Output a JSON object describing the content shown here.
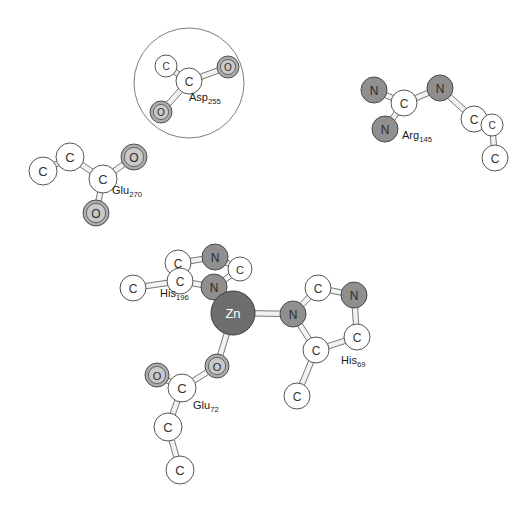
{
  "figure": {
    "title": "",
    "type": "molecular-structure-diagram",
    "style": "ball-and-stick",
    "background_color": "#ffffff"
  },
  "colors": {
    "carbon_fill": "#ffffff",
    "carbon_stroke": "#555555",
    "carbon_text": "#333333",
    "nitrogen_fill": "#8f8f8f",
    "nitrogen_stroke": "#4a4a4a",
    "nitrogen_text": "#2b2b2b",
    "oxygen_fill": "#ababab",
    "oxygen_stroke": "#4f4f4f",
    "oxygen_text": "#2b2b2b",
    "oxygen_inner": "#c9c9c9",
    "zinc_fill": "#6d6d6d",
    "zinc_stroke": "#3c3c3c",
    "zinc_text": "#ffffff",
    "bond_stroke": "#6a6a6a",
    "bond_fill": "#f2f2f2",
    "highlight_circle_stroke": "#7d7d7d",
    "label_text": "#1a1a1a"
  },
  "residues": [
    {
      "id": "asp255",
      "name": "Asp",
      "number": "255",
      "label": "Asp255",
      "label_x": 189,
      "label_y": 101,
      "label_size": 11
    },
    {
      "id": "glu270",
      "name": "Glu",
      "number": "270",
      "label": "Glu270",
      "label_x": 112,
      "label_y": 194,
      "label_size": 11
    },
    {
      "id": "arg145",
      "name": "Arg",
      "number": "145",
      "label": "Arg145",
      "label_x": 402,
      "label_y": 139,
      "label_size": 11
    },
    {
      "id": "his196",
      "name": "His",
      "number": "196",
      "label": "His196",
      "label_x": 160,
      "label_y": 297,
      "label_size": 11
    },
    {
      "id": "his69",
      "name": "His",
      "number": "69",
      "label": "His69",
      "label_x": 341,
      "label_y": 364,
      "label_size": 11
    },
    {
      "id": "glu72",
      "name": "Glu",
      "number": "72",
      "label": "Glu72",
      "label_x": 193,
      "label_y": 409,
      "label_size": 11
    }
  ],
  "highlight_circle": {
    "name": "asp255-highlight-circle",
    "cx": 189,
    "cy": 83,
    "r": 55
  },
  "chart_data": {
    "type": "diagram",
    "atoms": [
      {
        "id": "asp255-c1",
        "element": "C",
        "label": "C",
        "x": 166,
        "y": 66,
        "r": 11,
        "residue": "asp255"
      },
      {
        "id": "asp255-c2",
        "element": "C",
        "label": "C",
        "x": 189,
        "y": 81,
        "r": 13,
        "residue": "asp255"
      },
      {
        "id": "asp255-o1",
        "element": "O",
        "label": "O",
        "x": 228,
        "y": 67,
        "r": 11,
        "residue": "asp255"
      },
      {
        "id": "asp255-o2",
        "element": "O",
        "label": "O",
        "x": 161,
        "y": 112,
        "r": 11,
        "residue": "asp255"
      },
      {
        "id": "glu270-c1",
        "element": "C",
        "label": "C",
        "x": 43,
        "y": 171,
        "r": 14,
        "residue": "glu270"
      },
      {
        "id": "glu270-c2",
        "element": "C",
        "label": "C",
        "x": 70,
        "y": 157,
        "r": 14,
        "residue": "glu270"
      },
      {
        "id": "glu270-c3",
        "element": "C",
        "label": "C",
        "x": 103,
        "y": 179,
        "r": 14,
        "residue": "glu270"
      },
      {
        "id": "glu270-o1",
        "element": "O",
        "label": "O",
        "x": 134,
        "y": 157,
        "r": 13,
        "residue": "glu270"
      },
      {
        "id": "glu270-o2",
        "element": "O",
        "label": "O",
        "x": 96,
        "y": 213,
        "r": 13,
        "residue": "glu270"
      },
      {
        "id": "arg145-n1",
        "element": "N",
        "label": "N",
        "x": 374,
        "y": 90,
        "r": 13,
        "residue": "arg145"
      },
      {
        "id": "arg145-c1",
        "element": "C",
        "label": "C",
        "x": 404,
        "y": 103,
        "r": 13,
        "residue": "arg145"
      },
      {
        "id": "arg145-n2",
        "element": "N",
        "label": "N",
        "x": 385,
        "y": 129,
        "r": 13,
        "residue": "arg145"
      },
      {
        "id": "arg145-n3",
        "element": "N",
        "label": "N",
        "x": 440,
        "y": 88,
        "r": 13,
        "residue": "arg145"
      },
      {
        "id": "arg145-c2",
        "element": "C",
        "label": "C",
        "x": 474,
        "y": 119,
        "r": 13,
        "residue": "arg145"
      },
      {
        "id": "arg145-c3",
        "element": "C",
        "label": "C",
        "x": 492,
        "y": 125,
        "r": 11,
        "residue": "arg145"
      },
      {
        "id": "arg145-c4",
        "element": "C",
        "label": "C",
        "x": 495,
        "y": 158,
        "r": 13,
        "residue": "arg145"
      },
      {
        "id": "his196-c-sub",
        "element": "C",
        "label": "C",
        "x": 133,
        "y": 288,
        "r": 13,
        "residue": "his196"
      },
      {
        "id": "his196-c1",
        "element": "C",
        "label": "C",
        "x": 178,
        "y": 263,
        "r": 13,
        "residue": "his196"
      },
      {
        "id": "his196-c2",
        "element": "C",
        "label": "C",
        "x": 180,
        "y": 281,
        "r": 13,
        "residue": "his196"
      },
      {
        "id": "his196-n1",
        "element": "N",
        "label": "N",
        "x": 215,
        "y": 257,
        "r": 13,
        "residue": "his196"
      },
      {
        "id": "his196-c3",
        "element": "C",
        "label": "C",
        "x": 240,
        "y": 269,
        "r": 12,
        "residue": "his196"
      },
      {
        "id": "his196-n2",
        "element": "N",
        "label": "N",
        "x": 214,
        "y": 287,
        "r": 13,
        "residue": "his196"
      },
      {
        "id": "zn",
        "element": "Zn",
        "label": "Zn",
        "x": 233,
        "y": 313,
        "r": 22,
        "residue": "zinc"
      },
      {
        "id": "his69-n1",
        "element": "N",
        "label": "N",
        "x": 293,
        "y": 314,
        "r": 13,
        "residue": "his69"
      },
      {
        "id": "his69-c1",
        "element": "C",
        "label": "C",
        "x": 318,
        "y": 288,
        "r": 13,
        "residue": "his69"
      },
      {
        "id": "his69-n2",
        "element": "N",
        "label": "N",
        "x": 354,
        "y": 295,
        "r": 13,
        "residue": "his69"
      },
      {
        "id": "his69-c2",
        "element": "C",
        "label": "C",
        "x": 357,
        "y": 337,
        "r": 13,
        "residue": "his69"
      },
      {
        "id": "his69-c3",
        "element": "C",
        "label": "C",
        "x": 316,
        "y": 350,
        "r": 13,
        "residue": "his69"
      },
      {
        "id": "his69-c-sub",
        "element": "C",
        "label": "C",
        "x": 297,
        "y": 396,
        "r": 13,
        "residue": "his69"
      },
      {
        "id": "glu72-o1",
        "element": "O",
        "label": "O",
        "x": 217,
        "y": 366,
        "r": 12,
        "residue": "glu72"
      },
      {
        "id": "glu72-o2",
        "element": "O",
        "label": "O",
        "x": 157,
        "y": 375,
        "r": 12,
        "residue": "glu72"
      },
      {
        "id": "glu72-c1",
        "element": "C",
        "label": "C",
        "x": 182,
        "y": 388,
        "r": 14,
        "residue": "glu72"
      },
      {
        "id": "glu72-c2",
        "element": "C",
        "label": "C",
        "x": 168,
        "y": 427,
        "r": 14,
        "residue": "glu72"
      },
      {
        "id": "glu72-c3",
        "element": "C",
        "label": "C",
        "x": 180,
        "y": 470,
        "r": 14,
        "residue": "glu72"
      }
    ],
    "bonds": [
      {
        "from": "asp255-c1",
        "to": "asp255-c2"
      },
      {
        "from": "asp255-c2",
        "to": "asp255-o1"
      },
      {
        "from": "asp255-c2",
        "to": "asp255-o2"
      },
      {
        "from": "glu270-c1",
        "to": "glu270-c2"
      },
      {
        "from": "glu270-c2",
        "to": "glu270-c3"
      },
      {
        "from": "glu270-c3",
        "to": "glu270-o1"
      },
      {
        "from": "glu270-c3",
        "to": "glu270-o2"
      },
      {
        "from": "arg145-n1",
        "to": "arg145-c1"
      },
      {
        "from": "arg145-c1",
        "to": "arg145-n2"
      },
      {
        "from": "arg145-c1",
        "to": "arg145-n3"
      },
      {
        "from": "arg145-n3",
        "to": "arg145-c2"
      },
      {
        "from": "arg145-c2",
        "to": "arg145-c3"
      },
      {
        "from": "arg145-c3",
        "to": "arg145-c4"
      },
      {
        "from": "his196-c-sub",
        "to": "his196-c2"
      },
      {
        "from": "his196-c1",
        "to": "his196-c2"
      },
      {
        "from": "his196-c1",
        "to": "his196-n1"
      },
      {
        "from": "his196-n1",
        "to": "his196-c3"
      },
      {
        "from": "his196-c3",
        "to": "his196-n2"
      },
      {
        "from": "his196-n2",
        "to": "his196-c2"
      },
      {
        "from": "his196-n2",
        "to": "zn"
      },
      {
        "from": "zn",
        "to": "his69-n1"
      },
      {
        "from": "his69-n1",
        "to": "his69-c1"
      },
      {
        "from": "his69-c1",
        "to": "his69-n2"
      },
      {
        "from": "his69-n2",
        "to": "his69-c2"
      },
      {
        "from": "his69-c2",
        "to": "his69-c3"
      },
      {
        "from": "his69-c3",
        "to": "his69-n1"
      },
      {
        "from": "his69-c3",
        "to": "his69-c-sub"
      },
      {
        "from": "zn",
        "to": "glu72-o1"
      },
      {
        "from": "glu72-o1",
        "to": "glu72-c1"
      },
      {
        "from": "glu72-c1",
        "to": "glu72-o2"
      },
      {
        "from": "glu72-c1",
        "to": "glu72-c2"
      },
      {
        "from": "glu72-c2",
        "to": "glu72-c3"
      }
    ],
    "legend": [],
    "annotations": [
      "Asp255",
      "Glu270",
      "Arg145",
      "His196",
      "His69",
      "Glu72",
      "Zn"
    ]
  }
}
